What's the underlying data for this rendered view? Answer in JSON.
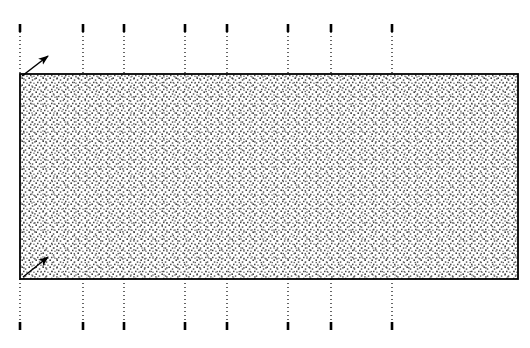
{
  "figure": {
    "type": "engineering-diagram",
    "title": "",
    "canvas": {
      "width": 530,
      "height": 348,
      "background": "#ffffff"
    },
    "colors": {
      "stroke": "#000000",
      "stipple": "#4d4d4d",
      "fill": "#ffffff",
      "background": "#ffffff"
    },
    "body": {
      "name": "stippled-rectangle",
      "shape": "rectangle",
      "x": 20,
      "y": 74,
      "width": 498,
      "height": 205,
      "fill_pattern": "stipple-dots",
      "outline": "solid",
      "outline_width": 1.6
    },
    "hatch": {
      "pattern": "stipple",
      "dot_size": 1.5,
      "cell": 7,
      "color": "#4d4d4d"
    },
    "leader_lines": {
      "style": "dotted",
      "dash_pattern": "1 3",
      "stroke_width": 1.2,
      "cap_segment_length": 8,
      "cap_stroke_width": 2.6,
      "top": {
        "name": "top-dotted-leader-lines",
        "count": 8,
        "y_start": 24,
        "y_end": 74,
        "x_positions": [
          20,
          83,
          124,
          185,
          227,
          288,
          331,
          392
        ]
      },
      "bottom": {
        "name": "bottom-dotted-leader-lines",
        "count": 8,
        "y_start": 279,
        "y_end": 330,
        "x_positions": [
          20,
          83,
          124,
          185,
          227,
          288,
          331,
          392
        ]
      }
    },
    "arrows": [
      {
        "name": "top-left-corner-arrow",
        "from": {
          "x": 22,
          "y": 76
        },
        "to": {
          "x": 48,
          "y": 56
        },
        "direction": "up-right",
        "head": "filled-wedge",
        "head_length": 9,
        "head_width": 7
      },
      {
        "name": "bottom-left-corner-arrow",
        "from": {
          "x": 23,
          "y": 277
        },
        "to": {
          "x": 48,
          "y": 257
        },
        "direction": "up-right",
        "head": "filled-wedge",
        "head_length": 9,
        "head_width": 7
      }
    ],
    "labels": []
  }
}
